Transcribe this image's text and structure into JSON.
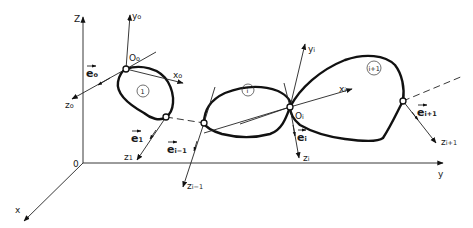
{
  "figure": {
    "colors": {
      "ink": "#111111",
      "background": "#ffffff"
    }
  },
  "global_axes": {
    "origin": "0",
    "x": "x",
    "y": "y",
    "z": "Z"
  },
  "frames": {
    "f0": {
      "origin": "O",
      "origin_sub": "o",
      "x": "x",
      "x_sub": "o",
      "y": "y",
      "y_sub": "o",
      "z": "z",
      "z_sub": "o",
      "e": "e",
      "e_sub": "o"
    },
    "f1": {
      "z": "z",
      "z_sub": "1",
      "e": "e",
      "e_sub": "1"
    },
    "fim1": {
      "z": "z",
      "z_sub": "i−1",
      "e": "e",
      "e_sub": "i−1"
    },
    "fi": {
      "origin": "O",
      "origin_sub": "i",
      "x": "x",
      "x_sub": "i",
      "y": "y",
      "y_sub": "i",
      "z": "z",
      "z_sub": "i",
      "e": "e",
      "e_sub": "i"
    },
    "fip1": {
      "z": "z",
      "z_sub": "i+1",
      "e": "e",
      "e_sub": "i+1"
    }
  },
  "bodies": [
    {
      "label": "1"
    },
    {
      "label": "i"
    },
    {
      "label": "i+1"
    }
  ]
}
